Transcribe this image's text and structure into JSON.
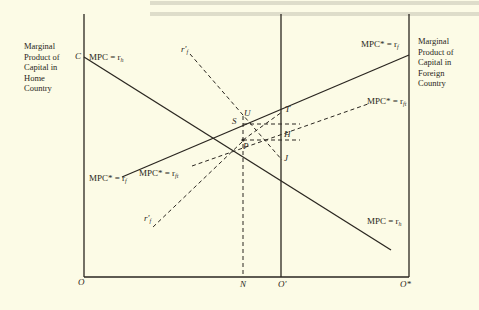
{
  "figure": {
    "background": "#fcfbe6",
    "ink": "#2a2620",
    "left_axis_title": [
      "Marginal",
      "Product of",
      "Capital in",
      "Home",
      "Country"
    ],
    "right_axis_title": [
      "Marginal",
      "Product of",
      "Capital in",
      "Foreign",
      "Country"
    ],
    "origin_labels": {
      "home": "O",
      "shift": "O'",
      "foreign": "O*",
      "n": "N"
    },
    "point_labels": {
      "C": "C",
      "U": "U",
      "S": "S",
      "T": "T",
      "H": "H",
      "P": "P",
      "J": "J"
    },
    "curve_labels": {
      "mpc_home_top": {
        "text": "MPC = r",
        "sub": "h"
      },
      "mpc_home_bottom": {
        "text": "MPC = r",
        "sub": "h"
      },
      "mpc_foreign_top": {
        "text": "MPC* = r",
        "sub": "f"
      },
      "mpc_foreign_left": {
        "text": "MPC* = r",
        "sub": "f"
      },
      "mpc_foreign_tax_right": {
        "text": "MPC* = r",
        "sub": "ft"
      },
      "mpc_foreign_tax_left": {
        "text": "MPC* = r",
        "sub": "ft"
      },
      "rf_prime_top": {
        "text": "r'",
        "sub": "f"
      },
      "rf_prime_bottom": {
        "text": "r'",
        "sub": "f"
      }
    }
  }
}
